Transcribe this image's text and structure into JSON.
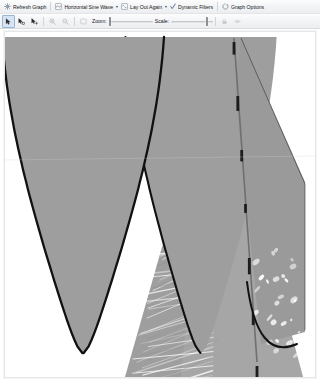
{
  "window": {
    "title": "Graph Pane"
  },
  "toolbar_top": {
    "refresh_label": "Refresh Graph",
    "refresh_icon": "refresh-graph-icon",
    "layout_label": "Horizontal Sine Wave",
    "layout_icon": "layout-icon",
    "lay_out_again_label": "Lay Out Again",
    "lay_out_again_icon": "lay-out-again-icon",
    "dynamic_filters_label": "Dynamic Filters",
    "dynamic_filters_icon": "check-icon",
    "graph_options_label": "Graph Options",
    "graph_options_icon": "gear-icon"
  },
  "toolbar_bottom": {
    "tools": [
      {
        "name": "select-tool",
        "icon": "cursor-arrow-icon",
        "selected": true,
        "enabled": true
      },
      {
        "name": "pan-select-tool",
        "icon": "cursor-arrow-move-icon",
        "selected": false,
        "enabled": true
      },
      {
        "name": "marquee-select-tool",
        "icon": "cursor-arrow-plus-icon",
        "selected": false,
        "enabled": true
      },
      {
        "name": "zoom-in-tool",
        "icon": "magnifier-plus-icon",
        "selected": false,
        "enabled": false
      },
      {
        "name": "zoom-out-tool",
        "icon": "magnifier-minus-icon",
        "selected": false,
        "enabled": false
      },
      {
        "name": "fit-to-window-tool",
        "icon": "fit-window-icon",
        "selected": false,
        "enabled": false
      }
    ],
    "zoom_label": "Zoom:",
    "zoom_value": 0,
    "scale_label": "Scale:",
    "scale_value": 88,
    "end_tools": [
      {
        "name": "lock-vertices-button",
        "icon": "lock-icon",
        "enabled": false
      },
      {
        "name": "show-vertices-button",
        "icon": "eye-icon",
        "enabled": false
      }
    ]
  },
  "graph": {
    "name": "graph-canvas",
    "layout": "Horizontal Sine Wave",
    "background_color": "#ffffff",
    "edge_color": "#9d9d9d",
    "edge_bundle_color": "#a6a6a6",
    "vertex_outline_color": "#111111",
    "lobe_fill_color": "#9e9e9e",
    "description": "Network graph rendered with a horizontal sine wave layout: two large sine lobes filled with dense gray edge bundles, outlined by heavy black vertex chains, plus a right-hand triangular fan of striated edges.",
    "lobes": [
      {
        "name": "left-sine-lobe",
        "cx": 78,
        "top": 36,
        "bottom": 352,
        "half_width": 60
      },
      {
        "name": "right-sine-lobe",
        "cx": 196,
        "top": 36,
        "bottom": 352,
        "half_width": 56
      }
    ],
    "fan": {
      "name": "right-edge-fan",
      "apex_x": 214,
      "apex_y": 34,
      "base_y": 352,
      "base_x0": 150,
      "base_x1": 300
    },
    "striation_count": 64,
    "vertex_markers": 7
  }
}
